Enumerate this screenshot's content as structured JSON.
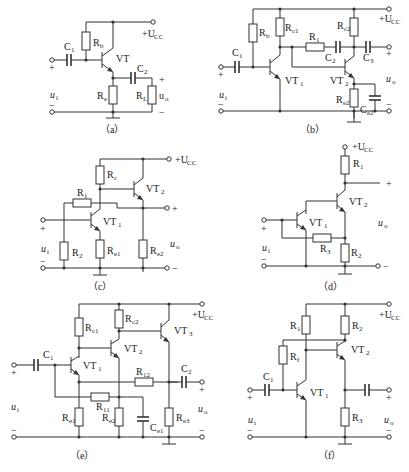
{
  "figure": {
    "supply_label": "+U",
    "supply_sub": "CC",
    "input_label": "u",
    "input_sub": "i",
    "output_label": "u",
    "output_sub": "o",
    "plus": "+",
    "minus": "−"
  },
  "circuits": {
    "a": {
      "caption": "（a）",
      "C1": "C",
      "C1_sub": "1",
      "Rb": "R",
      "Rb_sub": "b",
      "VT": "VT",
      "C2": "C",
      "C2_sub": "2",
      "Re": "R",
      "Re_sub": "e",
      "RL": "R",
      "RL_sub": "L"
    },
    "b": {
      "caption": "（b）",
      "C1": "C",
      "C1_sub": "1",
      "Rb": "R",
      "Rb_sub": "b",
      "Rc1": "R",
      "Rc1_sub": "c1",
      "R1": "R",
      "R1_sub": "1",
      "C2": "C",
      "C2_sub": "2",
      "Rc2": "R",
      "Rc2_sub": "c2",
      "C3": "C",
      "C3_sub": "3",
      "VT1": "VT",
      "VT1_sub": "1",
      "VT2": "VT",
      "VT2_sub": "2",
      "Re2": "R",
      "Re2_sub": "e2",
      "Ce2": "C",
      "Ce2_sub": "e2"
    },
    "c": {
      "caption": "（c）",
      "Rc": "R",
      "Rc_sub": "c",
      "R1": "R",
      "R1_sub": "1",
      "R2": "R",
      "R2_sub": "2",
      "VT1": "VT",
      "VT1_sub": "1",
      "VT2": "VT",
      "VT2_sub": "2",
      "Re1": "R",
      "Re1_sub": "e1",
      "Re2": "R",
      "Re2_sub": "e2"
    },
    "d": {
      "caption": "（d）",
      "R1": "R",
      "R1_sub": "1",
      "R2": "R",
      "R2_sub": "2",
      "R3": "R",
      "R3_sub": "3",
      "VT1": "VT",
      "VT1_sub": "1",
      "VT2": "VT",
      "VT2_sub": "2"
    },
    "e": {
      "caption": "（e）",
      "C1": "C",
      "C1_sub": "1",
      "Rc1": "R",
      "Rc1_sub": "c1",
      "Rc2": "R",
      "Rc2_sub": "c2",
      "VT1": "VT",
      "VT1_sub": "1",
      "VT2": "VT",
      "VT2_sub": "2",
      "VT3": "VT",
      "VT3_sub": "3",
      "R12": "R",
      "R12_sub": "12",
      "R11": "R",
      "R11_sub": "11",
      "C2": "C",
      "C2_sub": "2",
      "Re1": "R",
      "Re1_sub": "e1",
      "Re2": "R",
      "Re2_sub": "e2",
      "Ce1": "C",
      "Ce1_sub": "e1",
      "Re3": "R",
      "Re3_sub": "e3"
    },
    "f": {
      "caption": "（f）",
      "R1": "R",
      "R1_sub": "1",
      "R2": "R",
      "R2_sub": "2",
      "Rf": "R",
      "Rf_sub": "f",
      "C1": "C",
      "C1_sub": "1",
      "VT1": "VT",
      "VT1_sub": "1",
      "VT2": "VT",
      "VT2_sub": "2",
      "R3": "R",
      "R3_sub": "3"
    }
  }
}
